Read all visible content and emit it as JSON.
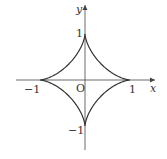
{
  "figure": {
    "colors": {
      "curve": "#333333",
      "axis": "#444444",
      "text": "#333333"
    }
  },
  "axes": {
    "x_label": "x",
    "y_label": "y",
    "origin_label": "O",
    "x_ticks": [
      {
        "value": -1,
        "label": "−1"
      },
      {
        "value": 1,
        "label": "1"
      }
    ],
    "y_ticks": [
      {
        "value": 1,
        "label": "1"
      },
      {
        "value": -1,
        "label": "−1"
      }
    ]
  },
  "curve": {
    "name": "astroid",
    "equation": "x^(2/3) + y^(2/3) = 1",
    "cusps": [
      [
        1,
        0
      ],
      [
        0,
        1
      ],
      [
        -1,
        0
      ],
      [
        0,
        -1
      ]
    ]
  }
}
